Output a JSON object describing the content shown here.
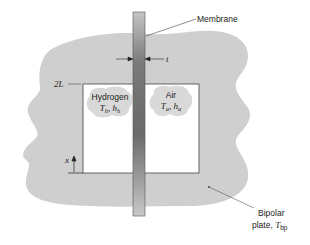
{
  "diagram": {
    "colors": {
      "blob_fill": "#cfcfcf",
      "cloud_fill": "#d9d9d9",
      "channel_fill": "#ffffff",
      "membrane_dark": "#6e6e6e",
      "membrane_light": "#bdbdbd",
      "line": "#444444"
    },
    "labels": {
      "membrane": "Membrane",
      "thickness": "t",
      "height": "2L",
      "axis": "x",
      "hydrogen": {
        "name": "Hydrogen",
        "T": "T",
        "T_sub": "h",
        "h": "h",
        "h_sub": "h",
        "sep": ", "
      },
      "air": {
        "name": "Air",
        "T": "T",
        "T_sub": "a",
        "h": "h",
        "h_sub": "a",
        "sep": ", "
      },
      "bipolar_line1": "Bipolar",
      "bipolar_line2": "plate, ",
      "bipolar_T": "T",
      "bipolar_T_sub": "bp"
    }
  }
}
